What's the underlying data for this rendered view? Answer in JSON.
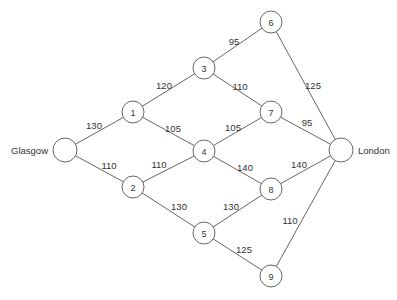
{
  "diagram": {
    "type": "weighted-network",
    "nodes": [
      {
        "id": "G",
        "label": "",
        "city_label": "Glasgow",
        "x": 65,
        "y": 150,
        "r": 12
      },
      {
        "id": "1",
        "label": "1",
        "x": 133,
        "y": 112,
        "r": 11
      },
      {
        "id": "2",
        "label": "2",
        "x": 133,
        "y": 187,
        "r": 11
      },
      {
        "id": "3",
        "label": "3",
        "x": 204,
        "y": 68,
        "r": 11
      },
      {
        "id": "4",
        "label": "4",
        "x": 204,
        "y": 151,
        "r": 11
      },
      {
        "id": "5",
        "label": "5",
        "x": 204,
        "y": 233,
        "r": 11
      },
      {
        "id": "6",
        "label": "6",
        "x": 271,
        "y": 22,
        "r": 11
      },
      {
        "id": "7",
        "label": "7",
        "x": 271,
        "y": 112,
        "r": 11
      },
      {
        "id": "8",
        "label": "8",
        "x": 271,
        "y": 189,
        "r": 11
      },
      {
        "id": "9",
        "label": "9",
        "x": 271,
        "y": 276,
        "r": 11
      },
      {
        "id": "L",
        "label": "",
        "city_label": "London",
        "x": 341,
        "y": 150,
        "r": 12
      }
    ],
    "edges": [
      {
        "from": "G",
        "to": "1",
        "weight": "130",
        "lx": 94,
        "ly": 125
      },
      {
        "from": "G",
        "to": "2",
        "weight": "110",
        "lx": 109,
        "ly": 165
      },
      {
        "from": "1",
        "to": "3",
        "weight": "120",
        "lx": 164,
        "ly": 85
      },
      {
        "from": "1",
        "to": "4",
        "weight": "105",
        "lx": 173,
        "ly": 128
      },
      {
        "from": "2",
        "to": "4",
        "weight": "110",
        "lx": 159,
        "ly": 164
      },
      {
        "from": "2",
        "to": "5",
        "weight": "130",
        "lx": 179,
        "ly": 206
      },
      {
        "from": "3",
        "to": "6",
        "weight": "95",
        "lx": 234,
        "ly": 41
      },
      {
        "from": "3",
        "to": "7",
        "weight": "110",
        "lx": 240,
        "ly": 86
      },
      {
        "from": "4",
        "to": "7",
        "weight": "105",
        "lx": 233,
        "ly": 127
      },
      {
        "from": "4",
        "to": "8",
        "weight": "140",
        "lx": 245,
        "ly": 167
      },
      {
        "from": "5",
        "to": "8",
        "weight": "130",
        "lx": 231,
        "ly": 206
      },
      {
        "from": "5",
        "to": "9",
        "weight": "125",
        "lx": 244,
        "ly": 249
      },
      {
        "from": "6",
        "to": "L",
        "weight": "125",
        "lx": 313,
        "ly": 85
      },
      {
        "from": "7",
        "to": "L",
        "weight": "95",
        "lx": 307,
        "ly": 122
      },
      {
        "from": "8",
        "to": "L",
        "weight": "140",
        "lx": 299,
        "ly": 164
      },
      {
        "from": "9",
        "to": "L",
        "weight": "110",
        "lx": 290,
        "ly": 220
      }
    ]
  }
}
